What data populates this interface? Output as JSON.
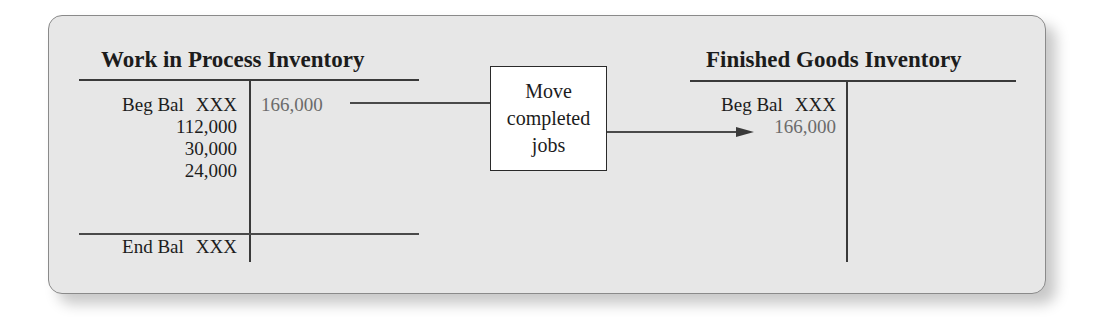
{
  "diagram": {
    "accounts": [
      {
        "title": "Work in Process Inventory",
        "debits": [
          {
            "label": "Beg Bal",
            "amount": "XXX"
          },
          {
            "label": "",
            "amount": "112,000"
          },
          {
            "label": "",
            "amount": "30,000"
          },
          {
            "label": "",
            "amount": "24,000"
          }
        ],
        "credits": [
          {
            "label": "",
            "amount": "166,000"
          }
        ],
        "ending": {
          "label": "End Bal",
          "amount": "XXX"
        }
      },
      {
        "title": "Finished Goods Inventory",
        "debits": [
          {
            "label": "Beg Bal",
            "amount": "XXX"
          },
          {
            "label": "",
            "amount": "166,000"
          }
        ],
        "credits": []
      }
    ],
    "transfer_box": {
      "lines": [
        "Move",
        "completed",
        "jobs"
      ]
    },
    "colors": {
      "panel_bg": "#e7e7e7",
      "text": "#1c1c1c",
      "transfer_amount": "#6b6b6b",
      "lines": "#3a3a3a",
      "box_bg": "#ffffff"
    }
  }
}
